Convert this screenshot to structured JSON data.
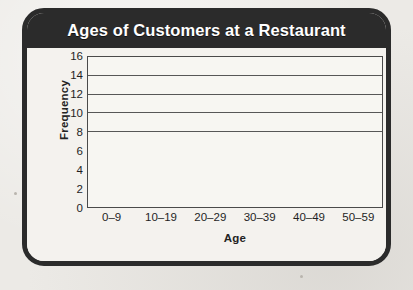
{
  "card": {
    "title": "Ages of Customers at a Restaurant"
  },
  "chart_data": {
    "type": "bar",
    "title": "Ages of Customers at a Restaurant",
    "xlabel": "Age",
    "ylabel": "Frequency",
    "categories": [
      "0–9",
      "10–19",
      "20–29",
      "30–39",
      "40–49",
      "50–59"
    ],
    "values": [
      6,
      9,
      13,
      11,
      15,
      9.4
    ],
    "ylim": [
      0,
      16
    ],
    "ytick_labels": [
      "0",
      "2",
      "4",
      "6",
      "8",
      "10",
      "12",
      "14",
      "16"
    ],
    "yticks": [
      0,
      2,
      4,
      6,
      8,
      10,
      12,
      14,
      16
    ],
    "gridlines": [
      8,
      10,
      12,
      14,
      16
    ],
    "grid": true,
    "legend": "none",
    "bar_colors": [
      "#8a8a8a",
      "#cdcbc6",
      "#8a8a8a",
      "#cdcbc6",
      "#8a8a8a",
      "#cdcbc6"
    ],
    "bar_styles": [
      "dark",
      "light",
      "dark",
      "light",
      "dark",
      "light"
    ],
    "bar_gap": 0
  },
  "colors": {
    "frame": "#2b2b2b",
    "title_text": "#ffffff",
    "card_background": "#f2f0ec",
    "plot_background": "#f7f6f2",
    "axis_line": "#4a4a4a",
    "gridline": "#575757",
    "bar_dark": "#8a8a8a",
    "bar_light": "#cdcbc6",
    "page_background": "#eceae6"
  }
}
